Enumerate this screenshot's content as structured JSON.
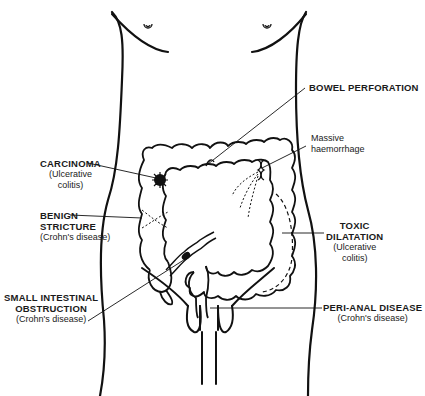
{
  "figure": {
    "labels": {
      "carcinoma": {
        "title": "CARCINOMA",
        "lines": [
          "(Ulcerative",
          "colitis)"
        ]
      },
      "benign_stricture": {
        "title_lines": [
          "BENIGN",
          "STRICTURE"
        ],
        "sub": "(Crohn's disease)"
      },
      "small_intestinal_obstruction": {
        "title_lines": [
          "SMALL INTESTINAL",
          "OBSTRUCTION"
        ],
        "sub": "(Crohn's disease)"
      },
      "bowel_perforation": {
        "title": "BOWEL PERFORATION"
      },
      "massive_haemorrhage": {
        "lines": [
          "Massive",
          "haemorrhage"
        ]
      },
      "toxic_dilatation": {
        "title_lines": [
          "TOXIC",
          "DILATATION"
        ],
        "lines": [
          "(Ulcerative",
          "colitis)"
        ]
      },
      "peri_anal_disease": {
        "title": "PERI-ANAL DISEASE",
        "sub": "(Crohn's disease)"
      }
    },
    "colors": {
      "ink": "#111111",
      "background": "#ffffff"
    }
  }
}
